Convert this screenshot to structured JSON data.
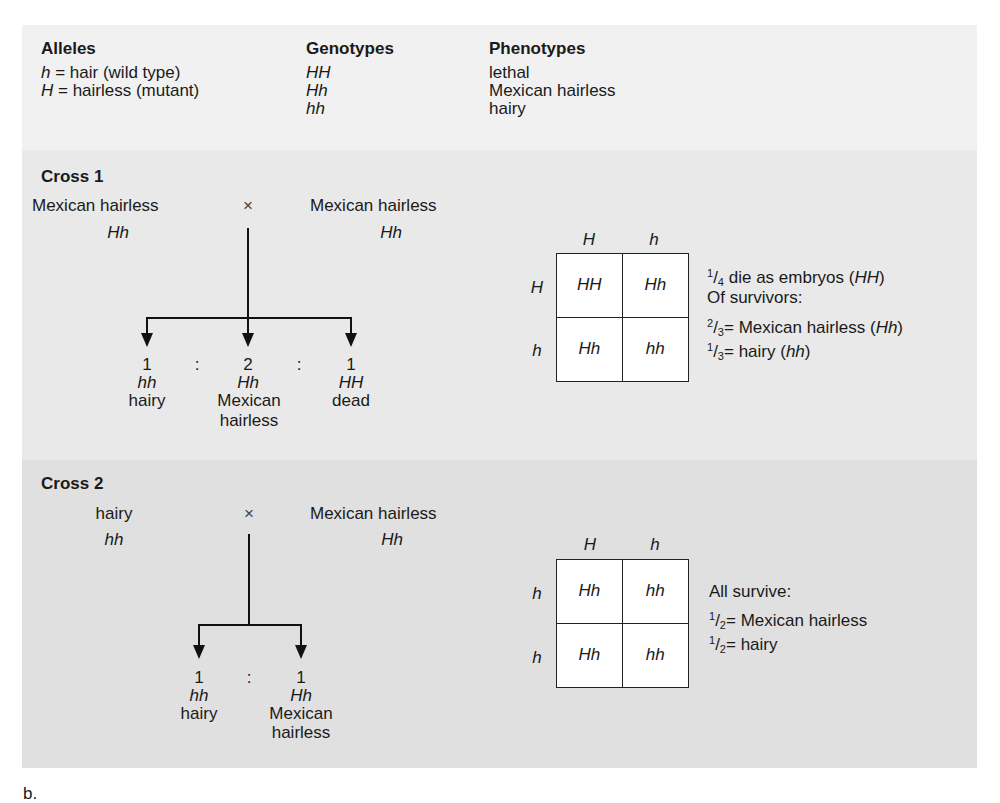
{
  "legend": {
    "alleles": {
      "heading": "Alleles",
      "items": [
        {
          "symbol": "h",
          "text": " = hair (wild type)"
        },
        {
          "symbol": "H",
          "text": " = hairless (mutant)"
        }
      ]
    },
    "genotypes": {
      "heading": "Genotypes",
      "items": [
        "HH",
        "Hh",
        "hh"
      ]
    },
    "phenotypes": {
      "heading": "Phenotypes",
      "items": [
        "lethal",
        "Mexican hairless",
        "hairy"
      ]
    }
  },
  "cross1": {
    "title": "Cross 1",
    "parent1": {
      "phenotype": "Mexican hairless",
      "genotype": "Hh"
    },
    "cross_symbol": "×",
    "parent2": {
      "phenotype": "Mexican hairless",
      "genotype": "Hh"
    },
    "offspring": [
      {
        "ratio": "1",
        "genotype": "hh",
        "phenotype": "hairy",
        "phenotype2": ""
      },
      {
        "ratio": "2",
        "genotype": "Hh",
        "phenotype": "Mexican",
        "phenotype2": "hairless"
      },
      {
        "ratio": "1",
        "genotype": "HH",
        "phenotype": "dead",
        "phenotype2": ""
      }
    ],
    "separator": ":",
    "punnett": {
      "col_headers": [
        "H",
        "h"
      ],
      "row_headers": [
        "H",
        "h"
      ],
      "cells": [
        [
          "HH",
          "Hh"
        ],
        [
          "Hh",
          "hh"
        ]
      ]
    },
    "notes": {
      "line1": {
        "num": "1",
        "den": "4",
        "text": "die as embryos (",
        "geno": "HH",
        "end": ")"
      },
      "line2": "Of survivors:",
      "line3": {
        "num": "2",
        "den": "3",
        "text": "= Mexican hairless (",
        "geno": "Hh",
        "end": ")"
      },
      "line4": {
        "num": "1",
        "den": "3",
        "text": "= hairy (",
        "geno": "hh",
        "end": ")"
      }
    }
  },
  "cross2": {
    "title": "Cross 2",
    "parent1": {
      "phenotype": "hairy",
      "genotype": "hh"
    },
    "cross_symbol": "×",
    "parent2": {
      "phenotype": "Mexican hairless",
      "genotype": "Hh"
    },
    "offspring": [
      {
        "ratio": "1",
        "genotype": "hh",
        "phenotype": "hairy",
        "phenotype2": ""
      },
      {
        "ratio": "1",
        "genotype": "Hh",
        "phenotype": "Mexican",
        "phenotype2": "hairless"
      }
    ],
    "separator": ":",
    "punnett": {
      "col_headers": [
        "H",
        "h"
      ],
      "row_headers": [
        "h",
        "h"
      ],
      "cells": [
        [
          "Hh",
          "hh"
        ],
        [
          "Hh",
          "hh"
        ]
      ]
    },
    "notes": {
      "line1": "All survive:",
      "line2": {
        "num": "1",
        "den": "2",
        "text": "= Mexican hairless"
      },
      "line3": {
        "num": "1",
        "den": "2",
        "text": "= hairy"
      }
    }
  },
  "figure_label": "b."
}
